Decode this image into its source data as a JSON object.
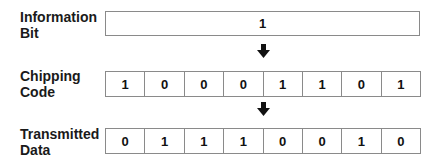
{
  "labels": {
    "information_bit": [
      "Information",
      "Bit"
    ],
    "chipping_code": [
      "Chipping",
      "Code"
    ],
    "transmitted_data": [
      "Transmitted",
      "Data"
    ]
  },
  "information_bit": {
    "value": "1"
  },
  "chipping_code": {
    "values": [
      "1",
      "0",
      "0",
      "0",
      "1",
      "1",
      "0",
      "1"
    ]
  },
  "transmitted_data": {
    "values": [
      "0",
      "1",
      "1",
      "1",
      "0",
      "0",
      "1",
      "0"
    ]
  },
  "colors": {
    "border": "#8a8a8a",
    "text": "#111111",
    "arrow": "#111111"
  }
}
